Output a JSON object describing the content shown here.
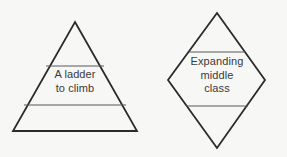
{
  "canvas": {
    "background_color": "#f7f7f6",
    "width": 287,
    "height": 157
  },
  "style": {
    "outline_color": "#2b2b2b",
    "divider_color": "#5a5a5a",
    "text_color": "#3a3a3a"
  },
  "shapes": {
    "pyramid": {
      "name": "pyramid",
      "label": "A ladder\nto climb",
      "label_lines": [
        "A ladder",
        "to climb"
      ],
      "outline_points": "75,22 137,131 13,131",
      "dividers": [
        {
          "x1": 46,
          "y1": 66,
          "x2": 104,
          "y2": 66
        },
        {
          "x1": 24,
          "y1": 105,
          "x2": 126,
          "y2": 105
        }
      ]
    },
    "diamond": {
      "name": "diamond",
      "label": "Expanding\nmiddle\nclass",
      "label_lines": [
        "Expanding",
        "middle",
        "class"
      ],
      "outline_points": "217,13 265,80 217,148 168,80",
      "dividers": [
        {
          "x1": 189,
          "y1": 52,
          "x2": 245,
          "y2": 52
        },
        {
          "x1": 186,
          "y1": 106,
          "x2": 248,
          "y2": 106
        }
      ]
    }
  }
}
